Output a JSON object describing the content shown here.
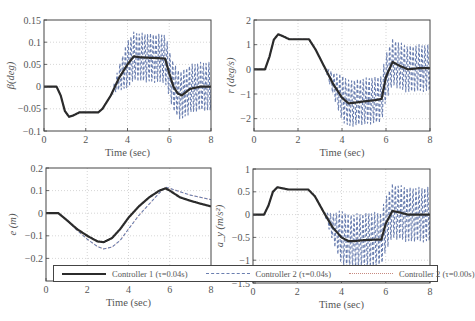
{
  "figure": {
    "legend": [
      {
        "label": "Controller 1 (τ=0.04s)",
        "style": "solid",
        "color": "#2b2b2b"
      },
      {
        "label": "Controller 2 (τ=0.04s)",
        "style": "dashed",
        "color": "#6b7fb0"
      },
      {
        "label": "Controller 2 (τ=0.00s)",
        "style": "dotted",
        "color": "#c78a80"
      }
    ]
  },
  "chart_data": [
    {
      "type": "line",
      "title": "",
      "xlabel": "Time (sec)",
      "ylabel": "β(deg)",
      "xlim": [
        0,
        8
      ],
      "ylim": [
        -0.1,
        0.15
      ],
      "xticks": [
        0,
        2,
        4,
        6,
        8
      ],
      "yticks": [
        -0.1,
        -0.05,
        0,
        0.05,
        0.1,
        0.15
      ],
      "ytick_labels": [
        "−0.1",
        "−0.05",
        "0",
        "0.05",
        "0.1",
        "0.15"
      ],
      "grid": true,
      "box": {
        "left": 44,
        "top": 20,
        "right": 211,
        "bottom": 131
      },
      "x": [
        0,
        0.6,
        0.8,
        1.0,
        1.2,
        1.4,
        1.7,
        2.0,
        2.6,
        2.8,
        3.2,
        3.6,
        4.0,
        4.3,
        4.6,
        5.0,
        5.5,
        5.8,
        6.0,
        6.2,
        6.4,
        6.6,
        7.0,
        7.5,
        8.0
      ],
      "series": [
        {
          "name": "Controller 1 (τ=0.04s)",
          "values": [
            0,
            0,
            -0.02,
            -0.055,
            -0.068,
            -0.065,
            -0.058,
            -0.058,
            -0.058,
            -0.05,
            -0.02,
            0.02,
            0.05,
            0.068,
            0.066,
            0.065,
            0.064,
            0.063,
            0.03,
            0.0,
            -0.015,
            -0.02,
            -0.005,
            0.0,
            0.0
          ]
        },
        {
          "name": "Controller 2 (τ=0.04s)",
          "values": [
            0,
            0,
            -0.02,
            -0.055,
            -0.068,
            -0.065,
            -0.058,
            -0.058,
            -0.058,
            -0.05,
            -0.02,
            0.02,
            0.05,
            0.068,
            0.066,
            0.065,
            0.064,
            0.063,
            0.03,
            0.0,
            -0.015,
            -0.02,
            -0.005,
            0.0,
            0.0
          ],
          "oscillation": {
            "start": 3.2,
            "end": 8.0,
            "amplitude": 0.055
          }
        },
        {
          "name": "Controller 2 (τ=0.00s)",
          "values": [
            0,
            0,
            -0.02,
            -0.055,
            -0.068,
            -0.065,
            -0.058,
            -0.058,
            -0.058,
            -0.05,
            -0.02,
            0.02,
            0.05,
            0.068,
            0.066,
            0.065,
            0.064,
            0.063,
            0.03,
            0.0,
            -0.015,
            -0.02,
            -0.005,
            0.0,
            0.0
          ]
        }
      ]
    },
    {
      "type": "line",
      "title": "",
      "xlabel": "Time (sec)",
      "ylabel": "r (deg/s)",
      "xlim": [
        0,
        8
      ],
      "ylim": [
        -2.5,
        2
      ],
      "xticks": [
        0,
        2,
        4,
        6,
        8
      ],
      "yticks": [
        -2,
        -1,
        0,
        1,
        2
      ],
      "ytick_labels": [
        "−2",
        "−1",
        "0",
        "1",
        "2"
      ],
      "grid": true,
      "box": {
        "left": 254,
        "top": 20,
        "right": 430,
        "bottom": 131
      },
      "x": [
        0,
        0.5,
        0.7,
        0.9,
        1.1,
        1.3,
        1.6,
        2.0,
        2.5,
        2.8,
        3.2,
        3.6,
        4.0,
        4.3,
        4.6,
        5.0,
        5.5,
        5.8,
        6.0,
        6.3,
        6.6,
        7.0,
        7.5,
        8.0
      ],
      "series": [
        {
          "name": "Controller 1 (τ=0.04s)",
          "values": [
            0,
            0,
            0.5,
            1.2,
            1.42,
            1.35,
            1.22,
            1.22,
            1.22,
            0.8,
            0.1,
            -0.6,
            -1.15,
            -1.38,
            -1.35,
            -1.3,
            -1.25,
            -1.2,
            -0.3,
            0.3,
            0.15,
            0.0,
            0.05,
            0.05
          ]
        },
        {
          "name": "Controller 2 (τ=0.04s)",
          "values": [
            0,
            0,
            0.5,
            1.2,
            1.42,
            1.35,
            1.22,
            1.22,
            1.22,
            0.8,
            0.1,
            -0.6,
            -1.15,
            -1.38,
            -1.35,
            -1.3,
            -1.25,
            -1.2,
            -0.3,
            0.3,
            0.15,
            0.0,
            0.05,
            0.05
          ],
          "oscillation": {
            "start": 3.2,
            "end": 8.0,
            "amplitude": 0.95
          }
        },
        {
          "name": "Controller 2 (τ=0.00s)",
          "values": [
            0,
            0,
            0.5,
            1.2,
            1.42,
            1.35,
            1.22,
            1.22,
            1.22,
            0.8,
            0.1,
            -0.6,
            -1.15,
            -1.38,
            -1.35,
            -1.3,
            -1.25,
            -1.2,
            -0.3,
            0.3,
            0.15,
            0.0,
            0.05,
            0.05
          ]
        }
      ]
    },
    {
      "type": "line",
      "title": "",
      "xlabel": "Time (sec)",
      "ylabel": "e (m)",
      "xlim": [
        0,
        8
      ],
      "ylim": [
        -0.3,
        0.2
      ],
      "xticks": [
        0,
        2,
        4,
        6,
        8
      ],
      "yticks": [
        -0.2,
        -0.1,
        0,
        0.1,
        0.2
      ],
      "ytick_labels": [
        "−0.2",
        "−0.1",
        "0",
        "0.1",
        "0.2"
      ],
      "grid": true,
      "box": {
        "left": 46,
        "top": 168,
        "right": 211,
        "bottom": 281
      },
      "x": [
        0,
        0.6,
        1.0,
        1.5,
        2.0,
        2.5,
        2.8,
        3.2,
        3.6,
        4.0,
        4.5,
        5.0,
        5.5,
        5.8,
        6.0,
        6.5,
        7.0,
        7.5,
        8.0
      ],
      "series": [
        {
          "name": "Controller 1 (τ=0.04s)",
          "values": [
            0,
            0,
            -0.03,
            -0.07,
            -0.1,
            -0.125,
            -0.128,
            -0.11,
            -0.07,
            -0.02,
            0.03,
            0.07,
            0.1,
            0.11,
            0.1,
            0.07,
            0.055,
            0.042,
            0.03
          ]
        },
        {
          "name": "Controller 2 (τ=0.04s)",
          "values": [
            0,
            0,
            -0.03,
            -0.075,
            -0.115,
            -0.148,
            -0.158,
            -0.15,
            -0.12,
            -0.07,
            -0.01,
            0.04,
            0.09,
            0.115,
            0.11,
            0.095,
            0.08,
            0.07,
            0.06
          ]
        },
        {
          "name": "Controller 2 (τ=0.00s)",
          "values": [
            0,
            0,
            -0.03,
            -0.075,
            -0.115,
            -0.148,
            -0.158,
            -0.15,
            -0.12,
            -0.07,
            -0.01,
            0.04,
            0.09,
            0.115,
            0.11,
            0.095,
            0.08,
            0.07,
            0.06
          ]
        }
      ]
    },
    {
      "type": "line",
      "title": "",
      "xlabel": "Time (sec)",
      "ylabel": "a_y (m/s²)",
      "xlim": [
        0,
        8
      ],
      "ylim": [
        -1.5,
        1
      ],
      "xticks": [
        0,
        2,
        4,
        6,
        8
      ],
      "yticks": [
        -1.5,
        -1,
        -0.5,
        0,
        0.5,
        1
      ],
      "ytick_labels": [
        "−1.5",
        "−1",
        "−0.5",
        "0",
        "0.5",
        "1"
      ],
      "grid": true,
      "box": {
        "left": 253,
        "top": 169,
        "right": 430,
        "bottom": 283
      },
      "x": [
        0,
        0.5,
        0.7,
        0.9,
        1.1,
        1.3,
        1.6,
        2.0,
        2.5,
        2.8,
        3.2,
        3.6,
        4.0,
        4.3,
        4.6,
        5.0,
        5.5,
        5.8,
        6.0,
        6.3,
        6.6,
        7.0,
        7.5,
        8.0
      ],
      "series": [
        {
          "name": "Controller 1 (τ=0.04s)",
          "values": [
            0,
            0,
            0.2,
            0.5,
            0.6,
            0.58,
            0.55,
            0.55,
            0.55,
            0.4,
            0.05,
            -0.28,
            -0.5,
            -0.58,
            -0.58,
            -0.56,
            -0.55,
            -0.55,
            -0.2,
            0.08,
            0.05,
            0.0,
            0.0,
            0.0
          ]
        },
        {
          "name": "Controller 2 (τ=0.04s)",
          "values": [
            0,
            0,
            0.2,
            0.5,
            0.6,
            0.58,
            0.55,
            0.55,
            0.55,
            0.4,
            0.05,
            -0.28,
            -0.5,
            -0.58,
            -0.58,
            -0.56,
            -0.55,
            -0.55,
            -0.2,
            0.08,
            0.05,
            0.0,
            0.0,
            0.0
          ],
          "oscillation": {
            "start": 3.2,
            "end": 8.0,
            "amplitude": 0.6
          }
        },
        {
          "name": "Controller 2 (τ=0.00s)",
          "values": [
            0,
            0,
            0.2,
            0.5,
            0.6,
            0.58,
            0.55,
            0.55,
            0.55,
            0.4,
            0.05,
            -0.28,
            -0.5,
            -0.58,
            -0.58,
            -0.56,
            -0.55,
            -0.55,
            -0.2,
            0.08,
            0.05,
            0.0,
            0.0,
            0.0
          ]
        }
      ]
    }
  ]
}
